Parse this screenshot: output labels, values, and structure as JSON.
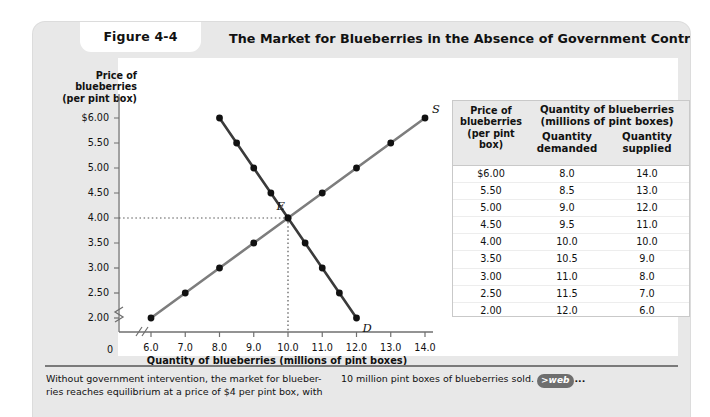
{
  "figure": {
    "badge": "Figure 4-4",
    "title": "The Market for Blueberries in the Absence of Government Controls"
  },
  "chart_data": {
    "type": "line",
    "title": "The Market for Blueberries in the Absence of Government Controls",
    "xlabel": "Quantity of blueberries (millions of pint boxes)",
    "ylabel": "Price of blueberries (per pint box)",
    "ylabel_lines": [
      "Price of",
      "blueberries",
      "(per pint box)"
    ],
    "xlim": [
      5.5,
      14.5
    ],
    "ylim": [
      1.75,
      6.25
    ],
    "x_axis_break": true,
    "y_axis_break": true,
    "grid": false,
    "origin_label": "0",
    "yticks": [
      "$6.00",
      "5.50",
      "5.00",
      "4.50",
      "4.00",
      "3.50",
      "3.00",
      "2.50",
      "2.00"
    ],
    "ytick_values": [
      6.0,
      5.5,
      5.0,
      4.5,
      4.0,
      3.5,
      3.0,
      2.5,
      2.0
    ],
    "xticks": [
      "6.0",
      "7.0",
      "8.0",
      "9.0",
      "10.0",
      "11.0",
      "12.0",
      "13.0",
      "14.0"
    ],
    "xtick_values": [
      6,
      7,
      8,
      9,
      10,
      11,
      12,
      13,
      14
    ],
    "series": [
      {
        "name": "Demand",
        "label": "D",
        "color": "#3b3b3b",
        "points": [
          {
            "x": 8.0,
            "y": 6.0
          },
          {
            "x": 8.5,
            "y": 5.5
          },
          {
            "x": 9.0,
            "y": 5.0
          },
          {
            "x": 9.5,
            "y": 4.5
          },
          {
            "x": 10.0,
            "y": 4.0
          },
          {
            "x": 10.5,
            "y": 3.5
          },
          {
            "x": 11.0,
            "y": 3.0
          },
          {
            "x": 11.5,
            "y": 2.5
          },
          {
            "x": 12.0,
            "y": 2.0
          }
        ]
      },
      {
        "name": "Supply",
        "label": "S",
        "color": "#7d7d7d",
        "points": [
          {
            "x": 6.0,
            "y": 2.0
          },
          {
            "x": 7.0,
            "y": 2.5
          },
          {
            "x": 8.0,
            "y": 3.0
          },
          {
            "x": 9.0,
            "y": 3.5
          },
          {
            "x": 10.0,
            "y": 4.0
          },
          {
            "x": 11.0,
            "y": 4.5
          },
          {
            "x": 12.0,
            "y": 5.0
          },
          {
            "x": 13.0,
            "y": 5.5
          },
          {
            "x": 14.0,
            "y": 6.0
          }
        ]
      }
    ],
    "annotations": [
      {
        "label": "E",
        "x": 10.0,
        "y": 4.0,
        "note": "equilibrium"
      }
    ],
    "guide_lines": {
      "price": 4.0,
      "quantity": 10.0,
      "style": "dotted"
    }
  },
  "table": {
    "header": {
      "price": [
        "Price of",
        "blueberries",
        "(per pint box)"
      ],
      "quantity_group": [
        "Quantity of blueberries",
        "(millions of pint boxes)"
      ],
      "demanded": [
        "Quantity",
        "demanded"
      ],
      "supplied": [
        "Quantity",
        "supplied"
      ]
    },
    "rows": [
      {
        "price": "$6.00",
        "demanded": "8.0",
        "supplied": "14.0"
      },
      {
        "price": "5.50",
        "demanded": "8.5",
        "supplied": "13.0"
      },
      {
        "price": "5.00",
        "demanded": "9.0",
        "supplied": "12.0"
      },
      {
        "price": "4.50",
        "demanded": "9.5",
        "supplied": "11.0"
      },
      {
        "price": "4.00",
        "demanded": "10.0",
        "supplied": "10.0"
      },
      {
        "price": "3.50",
        "demanded": "10.5",
        "supplied": "9.0"
      },
      {
        "price": "3.00",
        "demanded": "11.0",
        "supplied": "8.0"
      },
      {
        "price": "2.50",
        "demanded": "11.5",
        "supplied": "7.0"
      },
      {
        "price": "2.00",
        "demanded": "12.0",
        "supplied": "6.0"
      }
    ]
  },
  "caption": {
    "left": "Without government intervention, the market for blueber-ries reaches equilibrium at a price of $4 per pint box, with",
    "right_text": "10 million pint boxes of blueberries sold.",
    "web_badge": ">web",
    "web_tail": "..."
  }
}
